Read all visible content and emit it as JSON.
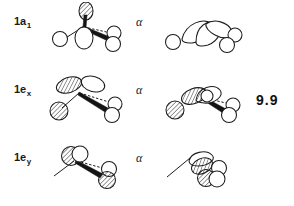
{
  "figure": {
    "kind": "molecular-orbital-diagram-figure",
    "background_color": "#ffffff",
    "ink_color": "#1c1c1c",
    "energy_value": "9.9",
    "rows": [
      {
        "id": "row-0",
        "label_base": "1a",
        "label_sub": "1",
        "label_text": "1a1",
        "spin_symbol": "α",
        "left_diagram_name": "orbital-1a1-alpha-left",
        "right_diagram_name": "orbital-1a1-alpha-right"
      },
      {
        "id": "row-1",
        "label_base": "1e",
        "label_sub": "x",
        "label_text": "1ex",
        "spin_symbol": "α",
        "left_diagram_name": "orbital-1ex-alpha-left",
        "right_diagram_name": "orbital-1ex-alpha-right"
      },
      {
        "id": "row-2",
        "label_base": "1e",
        "label_sub": "y",
        "label_text": "1ey",
        "spin_symbol": "α",
        "left_diagram_name": "orbital-1ey-alpha-left",
        "right_diagram_name": "orbital-1ey-alpha-right"
      }
    ]
  }
}
